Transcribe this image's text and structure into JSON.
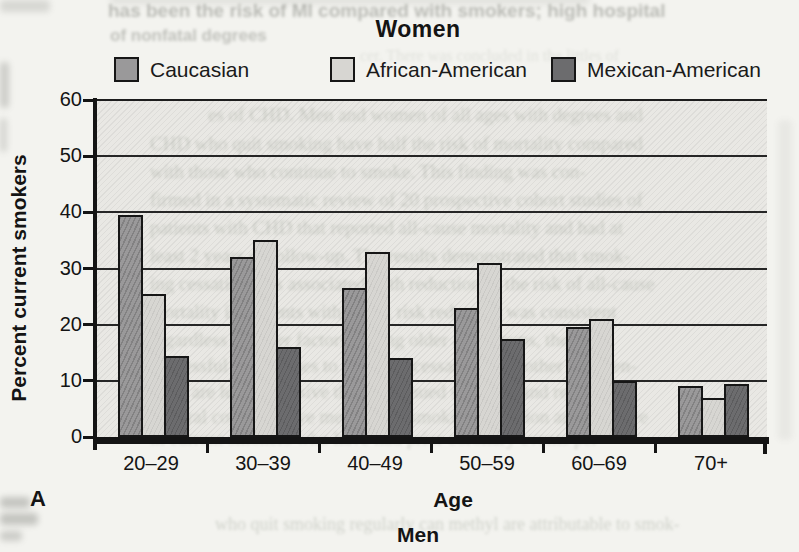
{
  "figure": {
    "panel_letter": "A",
    "bottom_caption": "Men"
  },
  "chart_data": {
    "type": "bar",
    "title": "Women",
    "xlabel": "Age",
    "ylabel": "Percent current smokers",
    "ylim": [
      0,
      60
    ],
    "yticks": [
      0,
      10,
      20,
      30,
      40,
      50,
      60
    ],
    "grid": "horizontal",
    "legend_position": "top",
    "categories": [
      "20–29",
      "30–39",
      "40–49",
      "50–59",
      "60–69",
      "70+"
    ],
    "series": [
      {
        "name": "Caucasian",
        "color": "#9a999a",
        "values": [
          39.5,
          32,
          26.5,
          23,
          19.5,
          9
        ]
      },
      {
        "name": "African-American",
        "color": "#d7d6d2",
        "values": [
          25.5,
          35,
          33,
          31,
          21,
          7
        ]
      },
      {
        "name": "Mexican-American",
        "color": "#6c6c6e",
        "values": [
          14.5,
          16,
          14,
          17.5,
          10,
          9.5
        ]
      }
    ]
  },
  "scan_artifacts": {
    "bleed_lines": [
      {
        "text": "has been the risk of MI compared with smokers; high hospital",
        "x": 108,
        "y": 0,
        "size": 19,
        "serif": false,
        "bold": true,
        "opacity": 0.5,
        "blur": 1.8
      },
      {
        "text": "of nonfatal degrees",
        "x": 110,
        "y": 26,
        "size": 17,
        "serif": false,
        "bold": true,
        "opacity": 0.45,
        "blur": 1.8
      },
      {
        "text": "cer. There was concluded in the littles of",
        "x": 360,
        "y": 47,
        "size": 16,
        "serif": true,
        "bold": false,
        "opacity": 0.22,
        "blur": 1.6
      },
      {
        "text": "es of CHD.  Men and women of all ages with degrees and",
        "x": 208,
        "y": 104,
        "size": 19,
        "serif": true,
        "bold": false,
        "opacity": 0.4,
        "blur": 1.4
      },
      {
        "text": "CHD who quit smoking have half the risk of mortality compared",
        "x": 150,
        "y": 133,
        "size": 19,
        "serif": true,
        "bold": false,
        "opacity": 0.42,
        "blur": 1.4
      },
      {
        "text": "with those who continue to smoke.  This finding was con-",
        "x": 150,
        "y": 161,
        "size": 19,
        "serif": true,
        "bold": false,
        "opacity": 0.42,
        "blur": 1.4
      },
      {
        "text": "firmed in a systematic review of 20 prospective cohort studies of",
        "x": 150,
        "y": 189,
        "size": 19,
        "serif": true,
        "bold": false,
        "opacity": 0.42,
        "blur": 1.4
      },
      {
        "text": "patients with CHD that reported all-cause mortality and had at",
        "x": 150,
        "y": 217,
        "size": 19,
        "serif": true,
        "bold": false,
        "opacity": 0.42,
        "blur": 1.4
      },
      {
        "text": "least 2 years of follow-up.  The results demonstrated that smok-",
        "x": 150,
        "y": 245,
        "size": 19,
        "serif": true,
        "bold": false,
        "opacity": 0.42,
        "blur": 1.4
      },
      {
        "text": "ing cessation was associated with reduction in the risk of all-cause",
        "x": 150,
        "y": 273,
        "size": 19,
        "serif": true,
        "bold": false,
        "opacity": 0.42,
        "blur": 1.4
      },
      {
        "text": "mortality in patients with CHD; risk reduction was consistent",
        "x": 150,
        "y": 301,
        "size": 19,
        "serif": true,
        "bold": false,
        "opacity": 0.42,
        "blur": 1.4
      },
      {
        "text": "regardless of other factors among older age groups, there are",
        "x": 150,
        "y": 329,
        "size": 19,
        "serif": true,
        "bold": false,
        "opacity": 0.4,
        "blur": 1.4
      },
      {
        "text": "successful approaches to smoking cessation, and other interven-",
        "x": 150,
        "y": 355,
        "size": 19,
        "serif": true,
        "bold": false,
        "opacity": 0.4,
        "blur": 1.4
      },
      {
        "text": "tions are less expensive than continued smoking and related",
        "x": 150,
        "y": 381,
        "size": 19,
        "serif": true,
        "bold": false,
        "opacity": 0.38,
        "blur": 1.4
      },
      {
        "text": "Several cost-effective methods of smoking cessation are effective",
        "x": 150,
        "y": 406,
        "size": 19,
        "serif": true,
        "bold": false,
        "opacity": 0.36,
        "blur": 1.4
      },
      {
        "text": "in current smokers who have had prior coronary events per-",
        "x": 150,
        "y": 428,
        "size": 19,
        "serif": true,
        "bold": false,
        "opacity": 0.32,
        "blur": 1.4
      },
      {
        "text": "who quit smoking regularly can methyl are attributable to smok-",
        "x": 215,
        "y": 514,
        "size": 18,
        "serif": true,
        "bold": false,
        "opacity": 0.4,
        "blur": 1.5
      }
    ],
    "smudges": [
      {
        "x": 0,
        "y": 0,
        "w": 50,
        "h": 12,
        "opacity": 0.18
      },
      {
        "x": 110,
        "y": -4,
        "w": 480,
        "h": 8,
        "opacity": 0.12
      },
      {
        "x": 0,
        "y": 62,
        "w": 9,
        "h": 46,
        "opacity": 0.25
      },
      {
        "x": 0,
        "y": 118,
        "w": 7,
        "h": 34,
        "opacity": 0.2
      },
      {
        "x": 0,
        "y": 497,
        "w": 30,
        "h": 11,
        "opacity": 0.3
      },
      {
        "x": 0,
        "y": 513,
        "w": 38,
        "h": 12,
        "opacity": 0.3
      },
      {
        "x": 0,
        "y": 531,
        "w": 22,
        "h": 10,
        "opacity": 0.25
      },
      {
        "x": 778,
        "y": 120,
        "w": 14,
        "h": 320,
        "opacity": 0.07
      }
    ]
  }
}
